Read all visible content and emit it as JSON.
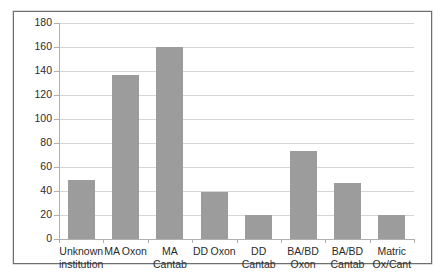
{
  "chart_data": {
    "type": "bar",
    "title": "",
    "subtitle": "",
    "xlabel": "",
    "ylabel": "",
    "categories": [
      "Unknown institution",
      "MA Oxon",
      "MA Cantab",
      "DD Oxon",
      "DD Cantab",
      "BA/BD Oxon",
      "BA/BD Cantab",
      "Matric Ox/Cant"
    ],
    "category_lines": [
      [
        "Unknown",
        "institution"
      ],
      [
        "MA Oxon"
      ],
      [
        "MA Cantab"
      ],
      [
        "DD Oxon"
      ],
      [
        "DD Cantab"
      ],
      [
        "BA/BD",
        "Oxon"
      ],
      [
        "BA/BD",
        "Cantab"
      ],
      [
        "Matric",
        "Ox/Cant"
      ]
    ],
    "values": [
      49,
      137,
      160,
      39,
      20,
      73,
      47,
      20
    ],
    "ylim": [
      0,
      180
    ],
    "ytick_values": [
      0,
      20,
      40,
      60,
      80,
      100,
      120,
      140,
      160,
      180
    ],
    "ytick_labels": [
      "0",
      "20",
      "40",
      "60",
      "80",
      "100",
      "120",
      "140",
      "160",
      "180"
    ],
    "grid": true,
    "grid_axis": "y",
    "legend": false,
    "legend_position": "none",
    "bar_color": "#9c9c9c",
    "gridline_color": "#d6d6d6",
    "axis_color": "#b0b0b0",
    "plot_background": "#ffffff",
    "frame_border_color": "#6e6e6e",
    "text_color": "#2b2b2b"
  }
}
